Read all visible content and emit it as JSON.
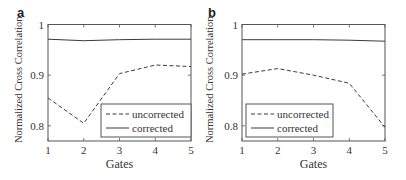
{
  "figure": {
    "background": "#ffffff",
    "line_color": "#3a3a3a",
    "frame_color": "#555555",
    "text_color": "#333333"
  },
  "chart_data": [
    {
      "type": "line",
      "panel_label": "a",
      "title": "",
      "xlabel": "Gates",
      "ylabel": "Normalized Cross Correlation",
      "x": [
        1,
        2,
        3,
        4,
        5
      ],
      "xticks": [
        1,
        2,
        3,
        4,
        5
      ],
      "xtick_labels": [
        "1",
        "2",
        "3",
        "4",
        "5"
      ],
      "yticks": [
        0.8,
        0.9,
        1
      ],
      "ytick_labels": [
        "0.8",
        "0.9",
        "1"
      ],
      "xlim": [
        1,
        5
      ],
      "ylim": [
        0.77,
        1.0
      ],
      "grid": false,
      "legend_position": "lower right",
      "series": [
        {
          "name": "uncorrected",
          "style": "dashed",
          "values": [
            0.855,
            0.805,
            0.903,
            0.92,
            0.917
          ]
        },
        {
          "name": "corrected",
          "style": "solid",
          "values": [
            0.971,
            0.968,
            0.97,
            0.971,
            0.971
          ]
        }
      ]
    },
    {
      "type": "line",
      "panel_label": "b",
      "title": "",
      "xlabel": "Gates",
      "ylabel": "Normalized Cross Correlation",
      "x": [
        1,
        2,
        3,
        4,
        5
      ],
      "xticks": [
        1,
        2,
        3,
        4,
        5
      ],
      "xtick_labels": [
        "1",
        "2",
        "3",
        "4",
        "5"
      ],
      "yticks": [
        0.8,
        0.9,
        1
      ],
      "ytick_labels": [
        "0.8",
        "0.9",
        "1"
      ],
      "xlim": [
        1,
        5
      ],
      "ylim": [
        0.77,
        1.0
      ],
      "grid": false,
      "legend_position": "lower left",
      "series": [
        {
          "name": "uncorrected",
          "style": "dashed",
          "values": [
            0.902,
            0.913,
            0.9,
            0.884,
            0.797
          ]
        },
        {
          "name": "corrected",
          "style": "solid",
          "values": [
            0.97,
            0.97,
            0.97,
            0.969,
            0.967
          ]
        }
      ]
    }
  ]
}
